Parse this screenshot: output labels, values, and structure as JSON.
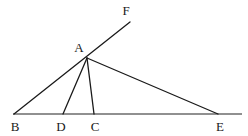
{
  "figure": {
    "background_color": "#ffffff",
    "baseline_color": "#6b6b6b",
    "segment_color": "#1a1a1a",
    "label_color": "#1a1a1a",
    "baseline_width": 1.6,
    "segment_width": 1.3,
    "points": {
      "A": {
        "x": 87,
        "y": 58,
        "label": "A",
        "label_x": 79,
        "label_y": 47
      },
      "B": {
        "x": 14,
        "y": 114,
        "label": "B",
        "label_x": 15,
        "label_y": 126
      },
      "C": {
        "x": 94,
        "y": 114,
        "label": "C",
        "label_x": 95,
        "label_y": 126
      },
      "D": {
        "x": 63,
        "y": 114,
        "label": "D",
        "label_x": 61,
        "label_y": 126
      },
      "E": {
        "x": 218,
        "y": 114,
        "label": "E",
        "label_x": 220,
        "label_y": 126
      },
      "F": {
        "x": 130,
        "y": 22,
        "label": "F",
        "label_x": 126,
        "label_y": 10
      }
    },
    "baseline": {
      "name": "base-line-BE",
      "x1": 13,
      "y1": 114,
      "x2": 242,
      "y2": 114
    },
    "segments": [
      {
        "name": "segment-B-F",
        "from": "B",
        "to": "F",
        "x1": 14,
        "y1": 114,
        "x2": 130,
        "y2": 22
      },
      {
        "name": "segment-A-E",
        "from": "A",
        "to": "E",
        "x1": 87,
        "y1": 58,
        "x2": 218,
        "y2": 114
      },
      {
        "name": "segment-A-D",
        "from": "A",
        "to": "D",
        "x1": 87,
        "y1": 58,
        "x2": 63,
        "y2": 114
      },
      {
        "name": "segment-A-C",
        "from": "A",
        "to": "C",
        "x1": 87,
        "y1": 58,
        "x2": 94,
        "y2": 114
      }
    ],
    "labels": [
      {
        "name": "point-label-F",
        "text": "F",
        "x": 126,
        "y": 10
      },
      {
        "name": "point-label-A",
        "text": "A",
        "x": 79,
        "y": 47
      },
      {
        "name": "point-label-B",
        "text": "B",
        "x": 15,
        "y": 126
      },
      {
        "name": "point-label-D",
        "text": "D",
        "x": 61,
        "y": 126
      },
      {
        "name": "point-label-C",
        "text": "C",
        "x": 95,
        "y": 126
      },
      {
        "name": "point-label-E",
        "text": "E",
        "x": 220,
        "y": 126
      }
    ]
  }
}
